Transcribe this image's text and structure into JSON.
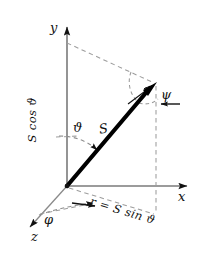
{
  "figure": {
    "background_color": "#ffffff",
    "ink_color": "#111111",
    "axis_color": "#6e6e6e",
    "dash_color": "#9a9a9a",
    "vector_color": "#000000",
    "width": 212,
    "height": 256
  },
  "axes": [
    {
      "name": "y-axis",
      "label": "y",
      "direction": "up"
    },
    {
      "name": "x-axis",
      "label": "x",
      "direction": "right"
    },
    {
      "name": "z-axis",
      "label": "z",
      "direction": "down-left"
    }
  ],
  "labels": {
    "y_axis": "y",
    "x_axis": "x",
    "z_axis": "z",
    "theta": "ϑ",
    "phi": "φ",
    "psi": "ψ",
    "vector": "S",
    "projection_vertical": "S cos ϑ",
    "projection_radial": "r = S sin ϑ"
  },
  "annotations": [
    {
      "name": "polar-angle",
      "symbol": "ϑ",
      "between": "y-axis and vector S"
    },
    {
      "name": "azimuthal-angle",
      "symbol": "φ",
      "between": "z-axis and radial projection r"
    },
    {
      "name": "precession-angle",
      "symbol": "ψ",
      "at": "vector tip"
    },
    {
      "name": "vector-magnitude",
      "symbol": "S",
      "description": "bold vector from origin"
    },
    {
      "name": "vertical-component",
      "symbol": "S cos ϑ",
      "description": "component along y-axis"
    },
    {
      "name": "radial-component",
      "symbol": "r = S sin ϑ",
      "description": "projection into x-z plane"
    }
  ],
  "geometry": {
    "origin": {
      "x": 67,
      "y": 186
    },
    "y_axis_tip": {
      "x": 67,
      "y": 16
    },
    "x_axis_tip": {
      "x": 197,
      "y": 186
    },
    "z_axis_tip": {
      "x": 22,
      "y": 233
    },
    "vector_tip": {
      "x": 155,
      "y": 84
    },
    "foot_of_perpendicular": {
      "x": 156,
      "y": 214
    }
  }
}
